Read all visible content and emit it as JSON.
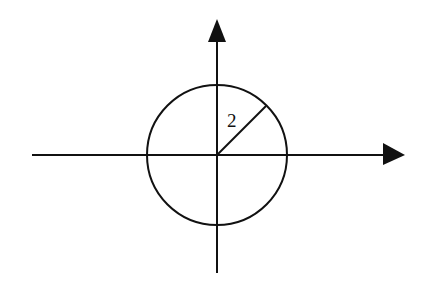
{
  "diagram": {
    "radius_label": "2",
    "colors": {
      "stroke": "#111111",
      "background": "#ffffff"
    },
    "geometry": {
      "center": [
        217,
        155
      ],
      "radius_px": 70,
      "x_axis": {
        "x1": 32,
        "x2": 383,
        "y": 155,
        "arrow": "right"
      },
      "y_axis": {
        "x": 217,
        "y1": 273,
        "y2": 42,
        "arrow": "up"
      },
      "radius_segment": {
        "from": [
          217,
          155
        ],
        "to": [
          266,
          106
        ]
      }
    }
  }
}
